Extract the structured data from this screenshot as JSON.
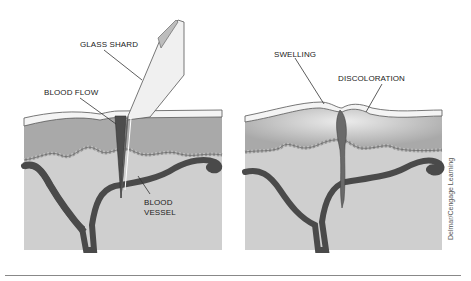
{
  "figure": {
    "left_panel": {
      "labels": {
        "glass_shard": "GLASS SHARD",
        "blood_flow": "BLOOD FLOW",
        "blood_vessel_line1": "BLOOD",
        "blood_vessel_line2": "VESSEL"
      }
    },
    "right_panel": {
      "labels": {
        "swelling": "SWELLING",
        "discoloration": "DISCOLORATION"
      }
    },
    "credit": "Delmar/Cengage Learning"
  },
  "colors": {
    "epidermis": "#f4f4f4",
    "dermis": "#a9a9a9",
    "subcutaneous": "#cfcfcf",
    "vessel": "#4a4a4a",
    "outline": "#555555",
    "swelling_highlight": "#e6e6e6"
  }
}
